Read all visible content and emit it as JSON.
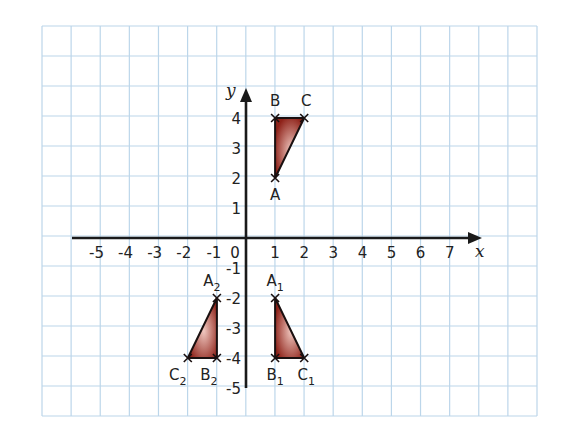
{
  "figure": {
    "grid": {
      "left": 42,
      "top": 26,
      "right": 537,
      "bottom": 416,
      "cols": 17,
      "rows": 13,
      "line_color": "#bcd6ea",
      "background": "#ffffff"
    },
    "axes": {
      "origin_px": [
        246,
        238
      ],
      "unit_x_px": 29.1,
      "unit_y_px": 30.0,
      "x_axis": {
        "from_px": 72,
        "to_px": 482,
        "label": "x"
      },
      "y_axis": {
        "from_px": 388,
        "to_px": 88,
        "label": "y"
      },
      "x_ticks": [
        "-5",
        "-4",
        "-3",
        "-2",
        "-1",
        "0",
        "1",
        "2",
        "3",
        "4",
        "5",
        "6",
        "7"
      ],
      "x_tick_values": [
        -5,
        -4,
        -3,
        -2,
        -1,
        0,
        1,
        2,
        3,
        4,
        5,
        6,
        7
      ],
      "y_ticks": [
        "4",
        "3",
        "2",
        "1",
        "-1",
        "-2",
        "-3",
        "-4",
        "-5"
      ],
      "y_tick_values": [
        4,
        3,
        2,
        1,
        -1,
        -2,
        -3,
        -4,
        -5
      ],
      "axis_color": "#1a1a1a"
    },
    "style": {
      "fill_dark": "#8e2219",
      "fill_light": "#f0c8c0",
      "stroke": "#1a1010"
    },
    "triangles": [
      {
        "name": "ABC",
        "points": [
          {
            "label": "A",
            "sub": "",
            "x": 1,
            "y": 2,
            "label_dx": 0,
            "label_dy": 22
          },
          {
            "label": "B",
            "sub": "",
            "x": 1,
            "y": 4,
            "label_dx": 0,
            "label_dy": -12
          },
          {
            "label": "C",
            "sub": "",
            "x": 2,
            "y": 4,
            "label_dx": 2,
            "label_dy": -12
          }
        ]
      },
      {
        "name": "A1B1C1",
        "points": [
          {
            "label": "A",
            "sub": "1",
            "x": 1,
            "y": -2,
            "label_dx": 0,
            "label_dy": -12
          },
          {
            "label": "B",
            "sub": "1",
            "x": 1,
            "y": -4,
            "label_dx": 0,
            "label_dy": 22
          },
          {
            "label": "C",
            "sub": "1",
            "x": 2,
            "y": -4,
            "label_dx": 2,
            "label_dy": 22
          }
        ]
      },
      {
        "name": "A2B2C2",
        "points": [
          {
            "label": "A",
            "sub": "2",
            "x": -1,
            "y": -2,
            "label_dx": -5,
            "label_dy": -12
          },
          {
            "label": "B",
            "sub": "2",
            "x": -1,
            "y": -4,
            "label_dx": -8,
            "label_dy": 22
          },
          {
            "label": "C",
            "sub": "2",
            "x": -2,
            "y": -4,
            "label_dx": -10,
            "label_dy": 22
          }
        ]
      }
    ]
  }
}
